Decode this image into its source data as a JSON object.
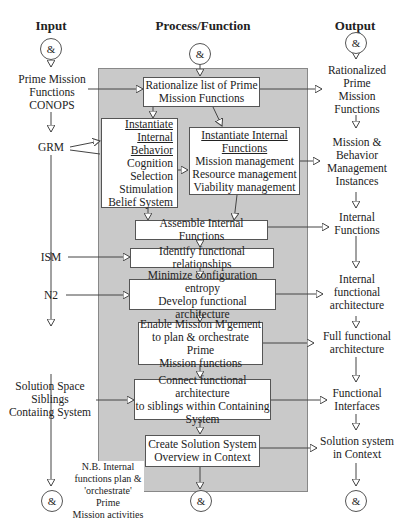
{
  "columns": {
    "input": "Input",
    "process": "Process/Function",
    "output": "Output"
  },
  "connector_symbol": "&",
  "inputs": [
    {
      "id": "in1",
      "label": "Prime Mission\nFunctions\nCONOPS"
    },
    {
      "id": "in2",
      "label": "GRM"
    },
    {
      "id": "in3",
      "label": "ISM"
    },
    {
      "id": "in4",
      "label": "N2"
    },
    {
      "id": "in5",
      "label": "Solution Space\nSiblings\nContaiing System"
    }
  ],
  "processes": [
    {
      "id": "p1",
      "label": "Rationalize list of Prime\nMission Functions"
    },
    {
      "id": "p2",
      "title": "Instantiate\nInternal\nBehavior",
      "label": "Cognition\nSelection\nStimulation\nBelief System"
    },
    {
      "id": "p3",
      "title": "Instantiate Internal\nFunctions",
      "label": "Mission management\nResource management\nViability management"
    },
    {
      "id": "p4",
      "label": "Assemble Internal Functions"
    },
    {
      "id": "p5",
      "label": "Identify functional relationships"
    },
    {
      "id": "p6",
      "label": "Minimize configuration entropy\nDevelop functional architecture"
    },
    {
      "id": "p7",
      "label": "Enable Mission M'gement\nto plan & orchestrate Prime\nMission functions"
    },
    {
      "id": "p8",
      "label": "Connect functional architecture\nto siblings within Containing\nSystem"
    },
    {
      "id": "p9",
      "label": "Create Solution System\nOverview in Context"
    }
  ],
  "outputs": [
    {
      "id": "o1",
      "label": "Rationalized\nPrime\nMission\nFunctions"
    },
    {
      "id": "o2",
      "label": "Mission &\nBehavior\nManagement\nInstances"
    },
    {
      "id": "o3",
      "label": "Internal\nFunctions"
    },
    {
      "id": "o4",
      "label": "Internal\nfunctional\narchitecture"
    },
    {
      "id": "o5",
      "label": "Full functional\narchitecture"
    },
    {
      "id": "o6",
      "label": "Functional\nInterfaces"
    },
    {
      "id": "o7",
      "label": "Solution system\nin Context"
    }
  ],
  "note": "N.B. Internal\nfunctions plan &\n'orchestrate' Prime\nMission activities"
}
